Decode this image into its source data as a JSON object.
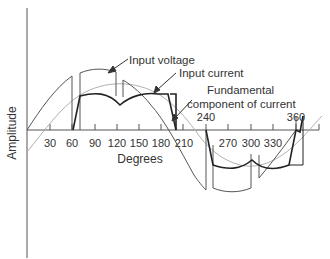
{
  "diagram": {
    "type": "waveform",
    "axes": {
      "x_label": "Degrees",
      "y_label": "Amplitude",
      "x_ticks_upper": [
        {
          "value": 30,
          "label": "30"
        },
        {
          "value": 60,
          "label": "60"
        },
        {
          "value": 90,
          "label": "90"
        },
        {
          "value": 120,
          "label": "120"
        },
        {
          "value": 150,
          "label": "150"
        },
        {
          "value": 180,
          "label": "180"
        },
        {
          "value": 210,
          "label": "210"
        },
        {
          "value": 270,
          "label": "270"
        },
        {
          "value": 300,
          "label": "300"
        },
        {
          "value": 330,
          "label": "330"
        }
      ],
      "x_ticks_offset": [
        {
          "value": 240,
          "label": "240"
        },
        {
          "value": 360,
          "label": "360"
        }
      ]
    },
    "annotations": {
      "input_voltage": "Input voltage",
      "input_current": "Input current",
      "fundamental_line1": "Fundamental",
      "fundamental_line2": "component of current"
    },
    "colors": {
      "voltage": "#555555",
      "current": "#222222",
      "fundamental": "#b0b0b0",
      "axis": "#555555"
    }
  }
}
